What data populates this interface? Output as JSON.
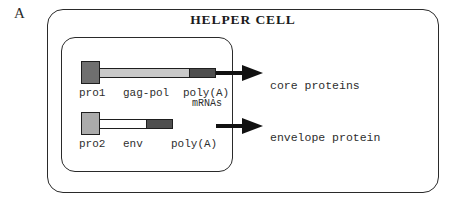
{
  "panel": {
    "letter": "A"
  },
  "cell": {
    "title": "HELPER CELL",
    "outer_label": "helper-cell-boundary",
    "inner_label": "nucleus-boundary"
  },
  "constructs": [
    {
      "id": "gag-pol",
      "promoter_label": "pro1",
      "gene_label": "gag-pol",
      "terminator_label": "poly(A)",
      "promoter_color": "#6f6f6f",
      "body_color": "#c9c9c9",
      "polya_color": "#4f4f4f"
    },
    {
      "id": "env",
      "promoter_label": "pro2",
      "gene_label": "env",
      "terminator_label": "poly(A)",
      "promoter_color": "#ababab",
      "body_color": "#ffffff",
      "polya_color": "#4f4f4f"
    }
  ],
  "annotations": {
    "mrnas": "mRNAs"
  },
  "products": [
    {
      "id": "core",
      "label": "core proteins"
    },
    {
      "id": "envelope",
      "label": "envelope protein"
    }
  ],
  "colors": {
    "stroke": "#2a2a2a",
    "text": "#2e2e2e",
    "arrow": "#111111",
    "background": "#ffffff"
  }
}
